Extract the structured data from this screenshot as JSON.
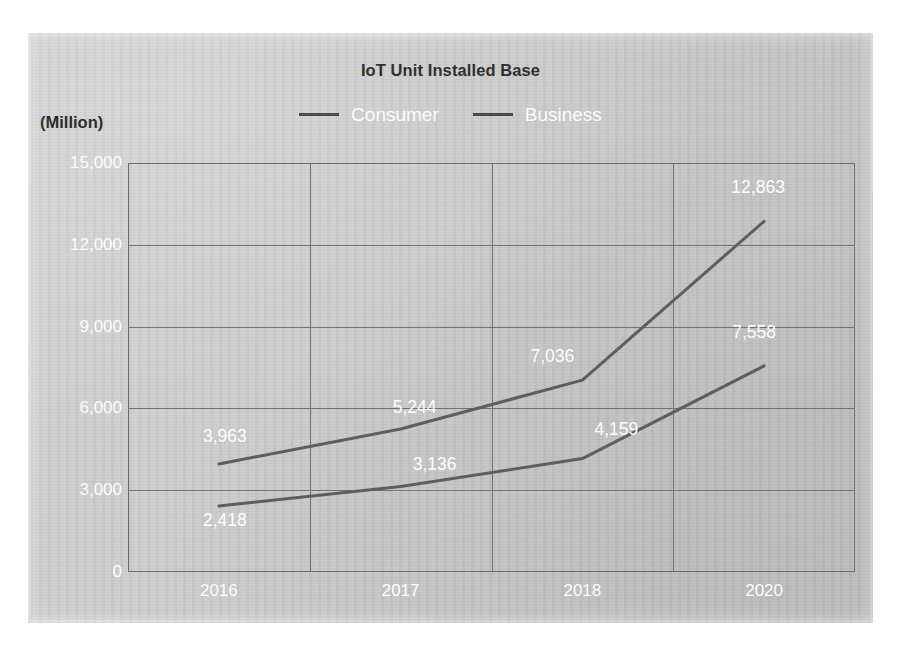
{
  "chart_data": {
    "type": "line",
    "title": "IoT Unit Installed Base",
    "unit_label": "(Million)",
    "xlabel": "",
    "ylabel": "(Million)",
    "categories": [
      "2016",
      "2017",
      "2018",
      "2020"
    ],
    "yticks": [
      "0",
      "3,000",
      "6,000",
      "9,000",
      "12,000",
      "15,000"
    ],
    "ytick_values": [
      0,
      3000,
      6000,
      9000,
      12000,
      15000
    ],
    "ylim": [
      0,
      15000
    ],
    "grid": true,
    "legend_position": "top",
    "series": [
      {
        "name": "Consumer",
        "color": "#5e5e5e",
        "values": [
          3963,
          5244,
          7036,
          12863
        ],
        "labels": [
          "3,963",
          "5,244",
          "7,036",
          "12,863"
        ]
      },
      {
        "name": "Business",
        "color": "#5e5e5e",
        "values": [
          2418,
          3136,
          4159,
          7558
        ],
        "labels": [
          "2,418",
          "3,136",
          "4,159",
          "7,558"
        ]
      }
    ]
  },
  "legend": {
    "items": [
      {
        "label": "Consumer",
        "swatch": "line-swatch-icon"
      },
      {
        "label": "Business",
        "swatch": "line-swatch-icon"
      }
    ]
  },
  "colors": {
    "panel_background": "#c9c9c9",
    "series_line": "#5e5e5e",
    "gridline": "#737373",
    "tick_label": "#fcfcfc",
    "data_label": "#fdfdfd",
    "title_text": "#2f2f2f"
  }
}
